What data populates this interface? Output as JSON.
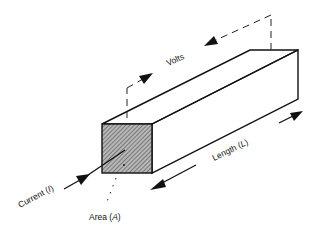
{
  "diagram": {
    "type": "conductor-bar-resistance",
    "labels": {
      "volts": "Volts",
      "length": "Length (",
      "length_var": "L",
      "length_close": ")",
      "current": "Current (",
      "current_var": "I",
      "current_close": ")",
      "area": "Area (",
      "area_var": "A",
      "area_close": ")"
    },
    "colors": {
      "stroke": "#111111",
      "hatch": "#8a8a8a",
      "background": "#ffffff"
    }
  }
}
